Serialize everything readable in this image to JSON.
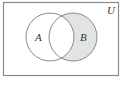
{
  "diagram": {
    "type": "venn",
    "universe_label": "U",
    "sets": [
      {
        "label": "A",
        "shaded": false
      },
      {
        "label": "B",
        "shaded": true
      }
    ],
    "shaded_region": "B only (B minus A)",
    "colors": {
      "stroke": "#8a8a8a",
      "shade": "#e3e3e3",
      "background": "#ffffff",
      "frame": "#8a8a8a"
    }
  }
}
